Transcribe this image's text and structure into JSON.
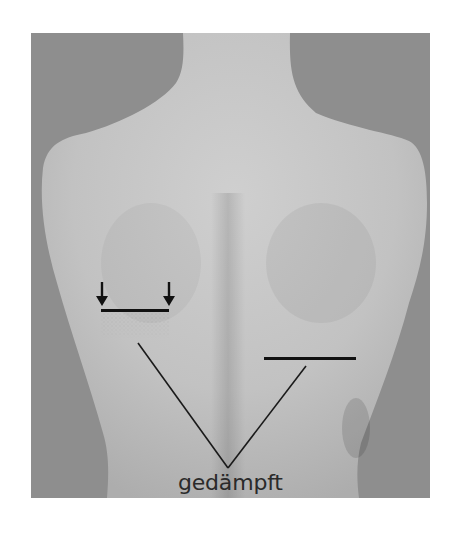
{
  "figure": {
    "background_color": "#8e8e8e",
    "skin_color": "#c4c4c4",
    "annotations": {
      "label": "gedämpft",
      "left_marker": {
        "type": "bar-with-stipple",
        "arrows": [
          "arrow-down-icon",
          "arrow-down-icon"
        ],
        "x_range": [
          101,
          169
        ],
        "y": 311
      },
      "right_marker": {
        "type": "line",
        "x_range": [
          264,
          356
        ],
        "y": 358
      },
      "leader_apex": [
        228,
        468
      ]
    },
    "colors": {
      "annotation": "#1a1a1a",
      "label_text": "#2a2a2a"
    }
  }
}
